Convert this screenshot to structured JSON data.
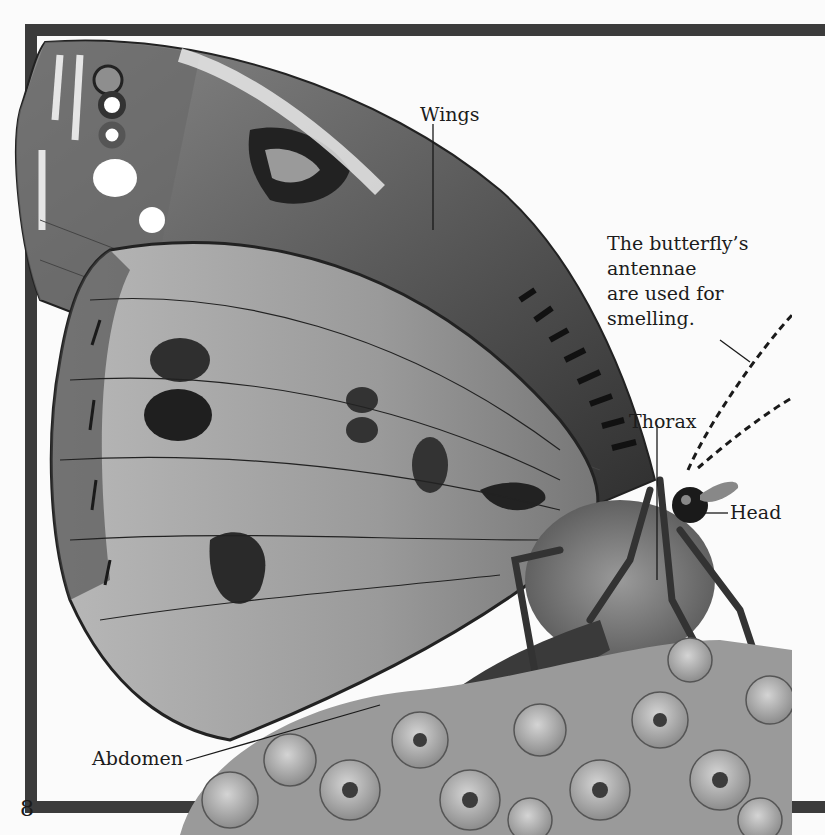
{
  "page": {
    "number": "8",
    "frame_color": "#3b3b3b",
    "background": "#fbfbfb"
  },
  "illustration": {
    "subject": "butterfly",
    "scene": "butterfly feeding on cluster of flowers"
  },
  "labels": {
    "wings": "Wings",
    "thorax": "Thorax",
    "head": "Head",
    "abdomen": "Abdomen"
  },
  "caption": {
    "lines": [
      "The butterfly’s",
      "antennae",
      "are used for",
      "smelling."
    ]
  }
}
